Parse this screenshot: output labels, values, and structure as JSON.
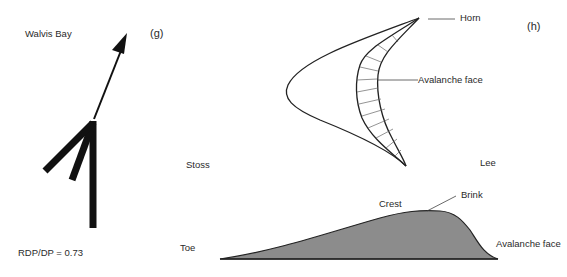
{
  "panel_g": {
    "label": "(g)",
    "location": "Walvis Bay",
    "ratio_text": "RDP/DP = 0.73",
    "wind_rose": {
      "arms": [
        {
          "direction": "N",
          "length": "long"
        },
        {
          "direction": "NNE (toward)",
          "length": "medium"
        },
        {
          "direction": "NE (toward)",
          "length": "medium"
        }
      ],
      "resultant_arrow": "NNE"
    }
  },
  "panel_h": {
    "label": "(h)",
    "plan_view": {
      "annotations": [
        "Horn",
        "Avalanche face"
      ],
      "side_labels": {
        "left": "Stoss",
        "right": "Lee"
      }
    },
    "profile_view": {
      "annotations": [
        "Toe",
        "Crest",
        "Brink",
        "Avalanche face"
      ]
    }
  },
  "colors": {
    "line": "#222222",
    "fill": "#8c8c8c",
    "hatch": "#555555"
  }
}
